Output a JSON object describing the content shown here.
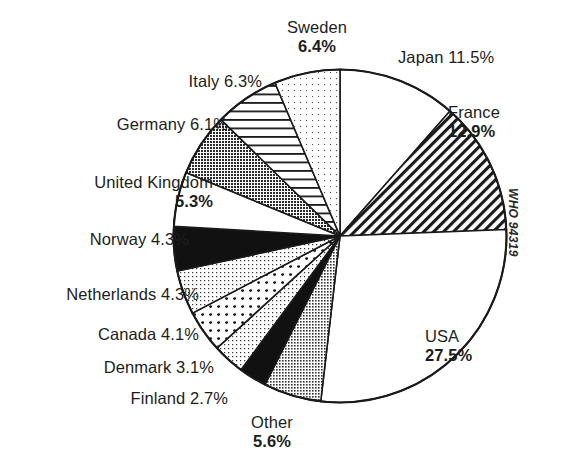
{
  "figure": {
    "title_fragment": "",
    "source_note": "WHO 94319"
  },
  "chart_data": {
    "type": "pie",
    "title": "",
    "xlabel": "",
    "ylabel": "",
    "legend_position": "callout-labels",
    "start_angle_deg": 0,
    "direction": "clockwise",
    "units": "percent",
    "categories": [
      "Japan",
      "France",
      "USA",
      "Other",
      "Finland",
      "Denmark",
      "Canada",
      "Netherlands",
      "Norway",
      "United Kingdom",
      "Germany",
      "Italy",
      "Sweden"
    ],
    "values": [
      11.5,
      12.9,
      27.5,
      5.6,
      2.7,
      3.1,
      4.1,
      4.3,
      4.3,
      5.3,
      6.1,
      6.3,
      6.4
    ],
    "slices": [
      {
        "name": "Japan",
        "value": 11.5,
        "label": "Japan 11.5%",
        "pattern": "blank"
      },
      {
        "name": "France",
        "value": 12.9,
        "label": "France",
        "value_label": "12.9%",
        "pattern": "diagonal-hatch"
      },
      {
        "name": "USA",
        "value": 27.5,
        "label": "USA",
        "value_label": "27.5%",
        "pattern": "blank"
      },
      {
        "name": "Other",
        "value": 5.6,
        "label": "Other",
        "value_label": "5.6%",
        "pattern": "stipple-medium"
      },
      {
        "name": "Finland",
        "value": 2.7,
        "label": "Finland 2.7%",
        "pattern": "solid-black"
      },
      {
        "name": "Denmark",
        "value": 3.1,
        "label": "Denmark 3.1%",
        "pattern": "stipple-light"
      },
      {
        "name": "Canada",
        "value": 4.1,
        "label": "Canada 4.1%",
        "pattern": "dots"
      },
      {
        "name": "Netherlands",
        "value": 4.3,
        "label": "Netherlands 4.3%",
        "pattern": "stipple-light"
      },
      {
        "name": "Norway",
        "value": 4.3,
        "label": "Norway 4.3%",
        "pattern": "solid-black"
      },
      {
        "name": "United Kingdom",
        "value": 5.3,
        "label": "United Kingdom",
        "value_label": "5.3%",
        "pattern": "blank"
      },
      {
        "name": "Germany",
        "value": 6.1,
        "label": "Germany 6.1%",
        "pattern": "stipple-dark"
      },
      {
        "name": "Italy",
        "value": 6.3,
        "label": "Italy 6.3%",
        "pattern": "horizontal-lines"
      },
      {
        "name": "Sweden",
        "value": 6.4,
        "label": "Sweden",
        "value_label": "6.4%",
        "pattern": "stipple-faint"
      }
    ],
    "colors": {
      "outline": "#1a1a1a",
      "blank": "#ffffff",
      "solid_black": "#111111",
      "stipple_dark": "#6f6f6f",
      "stipple_medium": "#9a9a9a",
      "stipple_light": "#d8d8d8",
      "stipple_faint": "#efefef"
    }
  },
  "labels": {
    "sweden_name": "Sweden",
    "sweden_pct": "6.4%",
    "japan": "Japan 11.5%",
    "italy": "Italy 6.3%",
    "france_name": "France",
    "france_pct": "12.9%",
    "germany": "Germany 6.1%",
    "uk_name": "United Kingdom",
    "uk_pct": "5.3%",
    "norway": "Norway 4.3%",
    "netherlands": "Netherlands 4.3%",
    "canada": "Canada 4.1%",
    "denmark": "Denmark 3.1%",
    "finland": "Finland 2.7%",
    "other_name": "Other",
    "other_pct": "5.6%",
    "usa_name": "USA",
    "usa_pct": "27.5%",
    "who": "WHO 94319"
  }
}
